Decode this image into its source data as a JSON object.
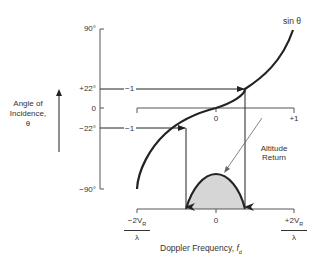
{
  "figure": {
    "curve_label": "sin θ",
    "y_axis": {
      "title_line1": "Angle of",
      "title_line2": "Incidence,",
      "title_line3": "θ",
      "ticks": [
        "90°",
        "+22°",
        "0",
        "−22°",
        "−90°"
      ]
    },
    "mid_axis": {
      "ticks": [
        "0",
        "+1"
      ],
      "mapping_labels": [
        "−1",
        "−1"
      ]
    },
    "x_axis": {
      "title_prefix": "Doppler Frequency, ",
      "title_var": "f",
      "title_sub": "d",
      "left_num_prefix": "−2V",
      "left_num_sub": "R",
      "left_den": "λ",
      "center": "0",
      "right_num_prefix": "+2V",
      "right_num_sub": "R",
      "right_den": "λ"
    },
    "annotation": {
      "line1": "Altitude",
      "line2": "Return"
    },
    "colors": {
      "ink": "#222222",
      "fill": "#d6d6d6"
    }
  }
}
